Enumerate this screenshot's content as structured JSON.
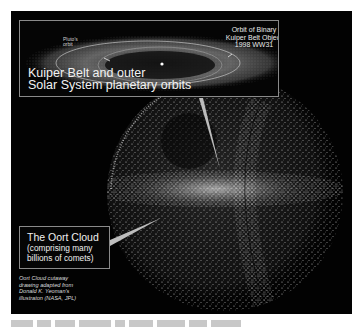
{
  "figure": {
    "kuiper_inset": {
      "title_line1": "Kuiper Belt and outer",
      "title_line2": "Solar System planetary orbits",
      "pluto_label_line1": "Pluto's",
      "pluto_label_line2": "orbit",
      "binary_label_line1": "Orbit of Binary",
      "binary_label_line2": "Kuiper Belt Object",
      "binary_label_line3": "1998 WW31"
    },
    "oort_label": {
      "line1": "The Oort Cloud",
      "line2": "(comprising many",
      "line3": "billions of comets)"
    },
    "credit": {
      "line1": "Oort Cloud cutaway",
      "line2": "drawing adapted from",
      "line3": "Donald K. Yeoman's",
      "line4": "illustraton (NASA, JPL)"
    },
    "colors": {
      "background": "#020202",
      "box_border": "#8a8a8a",
      "text": "#f0f0f0",
      "pointer": "#bdbdbd"
    }
  }
}
